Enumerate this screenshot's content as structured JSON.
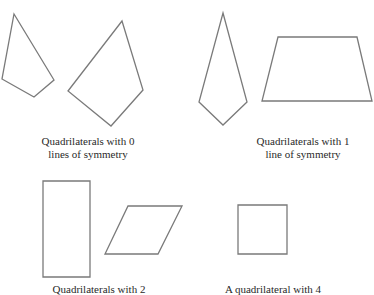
{
  "figure": {
    "groups": [
      {
        "id": "zero-lines",
        "caption_lines": [
          "Quadrilaterals with 0",
          "lines of symmetry"
        ],
        "shapes": [
          "irregular-quadrilateral",
          "irregular-quadrilateral"
        ]
      },
      {
        "id": "one-line",
        "caption_lines": [
          "Quadrilaterals with 1",
          "line of symmetry"
        ],
        "shapes": [
          "kite",
          "isosceles-trapezoid"
        ]
      },
      {
        "id": "two-lines",
        "caption_lines": [
          "Quadrilaterals with 2"
        ],
        "shapes": [
          "rectangle",
          "rhombus"
        ]
      },
      {
        "id": "four-lines",
        "caption_lines": [
          "A quadrilateral with 4"
        ],
        "shapes": [
          "square"
        ]
      }
    ],
    "colors": {
      "stroke": "#7a7a7a",
      "text": "#2a2a2a",
      "background": "#ffffff"
    }
  }
}
